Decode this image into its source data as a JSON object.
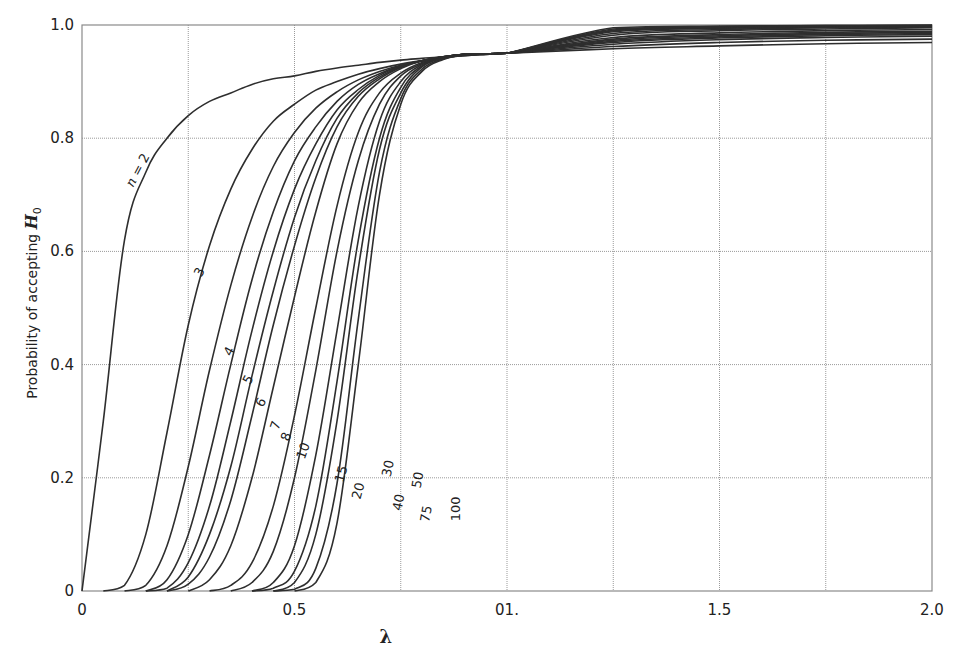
{
  "chart_data": {
    "type": "line",
    "title": "",
    "xlabel": "λ",
    "ylabel": "Probability of accepting H0",
    "xlim": [
      0,
      2.0
    ],
    "ylim": [
      0,
      1.0
    ],
    "grid": true,
    "x_ticks": [
      {
        "value": 0,
        "label": "0"
      },
      {
        "value": 0.5,
        "label": "0.5"
      },
      {
        "value": 1.0,
        "label": "01."
      },
      {
        "value": 1.5,
        "label": "1.5"
      },
      {
        "value": 2.0,
        "label": "2.0"
      }
    ],
    "y_ticks": [
      {
        "value": 0,
        "label": "0"
      },
      {
        "value": 0.2,
        "label": "0.2"
      },
      {
        "value": 0.4,
        "label": "0.4"
      },
      {
        "value": 0.6,
        "label": "0.6"
      },
      {
        "value": 0.8,
        "label": "0.8"
      },
      {
        "value": 1.0,
        "label": "1.0"
      }
    ],
    "x_grid_step": 0.25,
    "y_grid_step": 0.2,
    "legend": "inline curve labels",
    "x": [
      0,
      0.05,
      0.1,
      0.15,
      0.2,
      0.25,
      0.3,
      0.35,
      0.4,
      0.45,
      0.5,
      0.55,
      0.6,
      0.65,
      0.7,
      0.75,
      0.8,
      0.85,
      0.9,
      0.95,
      1.0,
      1.25,
      1.5,
      1.75,
      2.0
    ],
    "series": [
      {
        "name": "n = 2",
        "label": "n = 2",
        "values": [
          0,
          0.3,
          0.62,
          0.74,
          0.8,
          0.84,
          0.865,
          0.88,
          0.895,
          0.905,
          0.91,
          0.918,
          0.924,
          0.929,
          0.934,
          0.938,
          0.941,
          0.944,
          0.946,
          0.948,
          0.95,
          0.958,
          0.963,
          0.967,
          0.969
        ]
      },
      {
        "name": "n = 3",
        "label": "3",
        "values": [
          0,
          0,
          0.01,
          0.1,
          0.28,
          0.47,
          0.61,
          0.71,
          0.78,
          0.83,
          0.86,
          0.885,
          0.9,
          0.913,
          0.923,
          0.931,
          0.937,
          0.942,
          0.946,
          0.948,
          0.95,
          0.962,
          0.969,
          0.973,
          0.975
        ]
      },
      {
        "name": "n = 4",
        "label": "4",
        "values": [
          0,
          0,
          0,
          0.01,
          0.08,
          0.22,
          0.39,
          0.54,
          0.66,
          0.75,
          0.81,
          0.853,
          0.882,
          0.903,
          0.918,
          0.929,
          0.937,
          0.943,
          0.947,
          0.949,
          0.95,
          0.966,
          0.974,
          0.978,
          0.98
        ]
      },
      {
        "name": "n = 5",
        "label": "5",
        "values": [
          0,
          0,
          0,
          0,
          0.02,
          0.1,
          0.24,
          0.4,
          0.55,
          0.67,
          0.76,
          0.82,
          0.865,
          0.895,
          0.914,
          0.928,
          0.937,
          0.944,
          0.948,
          0.949,
          0.95,
          0.969,
          0.977,
          0.981,
          0.983
        ]
      },
      {
        "name": "n = 6",
        "label": "6",
        "values": [
          0,
          0,
          0,
          0,
          0.005,
          0.05,
          0.15,
          0.3,
          0.46,
          0.6,
          0.71,
          0.79,
          0.85,
          0.886,
          0.911,
          0.927,
          0.937,
          0.944,
          0.948,
          0.949,
          0.95,
          0.971,
          0.979,
          0.983,
          0.985
        ]
      },
      {
        "name": "n = 7",
        "label": "7",
        "values": [
          0,
          0,
          0,
          0,
          0,
          0.025,
          0.1,
          0.22,
          0.38,
          0.53,
          0.66,
          0.76,
          0.835,
          0.88,
          0.908,
          0.926,
          0.937,
          0.944,
          0.948,
          0.949,
          0.95,
          0.973,
          0.981,
          0.985,
          0.987
        ]
      },
      {
        "name": "n = 8",
        "label": "8",
        "values": [
          0,
          0,
          0,
          0,
          0,
          0.012,
          0.06,
          0.16,
          0.31,
          0.47,
          0.61,
          0.73,
          0.82,
          0.874,
          0.905,
          0.925,
          0.937,
          0.944,
          0.948,
          0.949,
          0.95,
          0.975,
          0.983,
          0.987,
          0.989
        ]
      },
      {
        "name": "n = 10",
        "label": "10",
        "values": [
          0,
          0,
          0,
          0,
          0,
          0,
          0.02,
          0.08,
          0.2,
          0.36,
          0.52,
          0.67,
          0.79,
          0.862,
          0.9,
          0.923,
          0.937,
          0.944,
          0.948,
          0.949,
          0.95,
          0.978,
          0.986,
          0.99,
          0.992
        ]
      },
      {
        "name": "n = 15",
        "label": "15",
        "values": [
          0,
          0,
          0,
          0,
          0,
          0,
          0,
          0.01,
          0.05,
          0.15,
          0.31,
          0.5,
          0.68,
          0.81,
          0.88,
          0.915,
          0.934,
          0.943,
          0.948,
          0.949,
          0.95,
          0.982,
          0.99,
          0.993,
          0.995
        ]
      },
      {
        "name": "n = 20",
        "label": "20",
        "values": [
          0,
          0,
          0,
          0,
          0,
          0,
          0,
          0,
          0.015,
          0.07,
          0.2,
          0.39,
          0.6,
          0.76,
          0.86,
          0.91,
          0.932,
          0.943,
          0.948,
          0.949,
          0.95,
          0.985,
          0.992,
          0.995,
          0.996
        ]
      },
      {
        "name": "n = 30",
        "label": "30",
        "values": [
          0,
          0,
          0,
          0,
          0,
          0,
          0,
          0,
          0,
          0.015,
          0.08,
          0.24,
          0.46,
          0.68,
          0.83,
          0.9,
          0.93,
          0.942,
          0.948,
          0.949,
          0.95,
          0.988,
          0.994,
          0.996,
          0.997
        ]
      },
      {
        "name": "n = 40",
        "label": "40",
        "values": [
          0,
          0,
          0,
          0,
          0,
          0,
          0,
          0,
          0,
          0.005,
          0.035,
          0.15,
          0.37,
          0.62,
          0.8,
          0.89,
          0.928,
          0.942,
          0.948,
          0.949,
          0.95,
          0.99,
          0.995,
          0.997,
          0.998
        ]
      },
      {
        "name": "n = 50",
        "label": "50",
        "values": [
          0,
          0,
          0,
          0,
          0,
          0,
          0,
          0,
          0,
          0,
          0.015,
          0.1,
          0.3,
          0.57,
          0.78,
          0.88,
          0.926,
          0.941,
          0.947,
          0.949,
          0.95,
          0.991,
          0.996,
          0.998,
          0.999
        ]
      },
      {
        "name": "n = 75",
        "label": "75",
        "values": [
          0,
          0,
          0,
          0,
          0,
          0,
          0,
          0,
          0,
          0,
          0.003,
          0.04,
          0.19,
          0.48,
          0.74,
          0.87,
          0.922,
          0.94,
          0.947,
          0.949,
          0.95,
          0.993,
          0.997,
          0.999,
          0.999
        ]
      },
      {
        "name": "n = 100",
        "label": "100",
        "values": [
          0,
          0,
          0,
          0,
          0,
          0,
          0,
          0,
          0,
          0,
          0,
          0.015,
          0.12,
          0.4,
          0.7,
          0.86,
          0.918,
          0.939,
          0.947,
          0.949,
          0.95,
          0.995,
          0.998,
          0.999,
          1.0
        ]
      }
    ],
    "annotations": [
      {
        "text": "n = 2",
        "x": 0.14,
        "y": 0.74,
        "rotate": -62
      },
      {
        "text": "3",
        "x": 0.285,
        "y": 0.56,
        "rotate": -62
      },
      {
        "text": "4",
        "x": 0.355,
        "y": 0.42,
        "rotate": -62
      },
      {
        "text": "5",
        "x": 0.4,
        "y": 0.37,
        "rotate": -62
      },
      {
        "text": "6",
        "x": 0.43,
        "y": 0.33,
        "rotate": -62
      },
      {
        "text": "7",
        "x": 0.465,
        "y": 0.29,
        "rotate": -70
      },
      {
        "text": "8",
        "x": 0.49,
        "y": 0.27,
        "rotate": -70
      },
      {
        "text": "10",
        "x": 0.53,
        "y": 0.245,
        "rotate": -70
      },
      {
        "text": "15",
        "x": 0.62,
        "y": 0.205,
        "rotate": -75
      },
      {
        "text": "20",
        "x": 0.66,
        "y": 0.175,
        "rotate": -75
      },
      {
        "text": "30",
        "x": 0.73,
        "y": 0.215,
        "rotate": -78
      },
      {
        "text": "40",
        "x": 0.755,
        "y": 0.155,
        "rotate": -78
      },
      {
        "text": "50",
        "x": 0.8,
        "y": 0.195,
        "rotate": -80
      },
      {
        "text": "75",
        "x": 0.82,
        "y": 0.135,
        "rotate": -80
      },
      {
        "text": "100",
        "x": 0.89,
        "y": 0.145,
        "rotate": -90
      }
    ]
  }
}
